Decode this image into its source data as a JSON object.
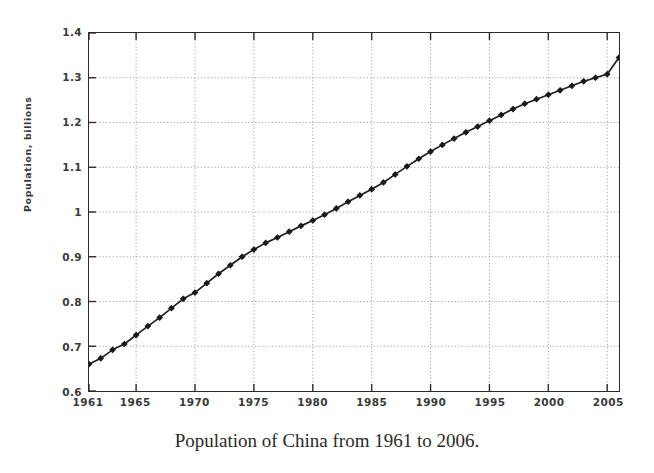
{
  "caption": "Population of China from 1961 to 2006.",
  "axes": {
    "y_title": "Population, billions",
    "y_tick_labels": [
      "1.4",
      "1.3",
      "1.2",
      "1.1",
      "1",
      "0.9",
      "0.8",
      "0.7",
      "0.6"
    ],
    "x_tick_labels": [
      "1961",
      "1965",
      "1970",
      "1975",
      "1980",
      "1985",
      "1990",
      "1995",
      "2000",
      "2005"
    ]
  },
  "colors": {
    "line": "#1f1f1f",
    "marker": "#1a1a1a",
    "grid": "#9a9a9a",
    "frame": "#2b2b2b",
    "text": "#3a3a3a",
    "background": "#ffffff"
  },
  "chart_data": {
    "type": "line",
    "title": "",
    "xlabel": "",
    "ylabel": "Population, billions",
    "xlim": [
      1961,
      2006
    ],
    "ylim": [
      0.6,
      1.4
    ],
    "grid": true,
    "legend": "none",
    "xticks": [
      1961,
      1965,
      1970,
      1975,
      1980,
      1985,
      1990,
      1995,
      2000,
      2005
    ],
    "yticks": [
      0.6,
      0.7,
      0.8,
      0.9,
      1.0,
      1.1,
      1.2,
      1.3,
      1.4
    ],
    "marker": "filled-diamond",
    "series": [
      {
        "name": "Population of China",
        "units": "billions",
        "x": [
          1961,
          1962,
          1963,
          1964,
          1965,
          1966,
          1967,
          1968,
          1969,
          1970,
          1971,
          1972,
          1973,
          1974,
          1975,
          1976,
          1977,
          1978,
          1979,
          1980,
          1981,
          1982,
          1983,
          1984,
          1985,
          1986,
          1987,
          1988,
          1989,
          1990,
          1991,
          1992,
          1993,
          1994,
          1995,
          1996,
          1997,
          1998,
          1999,
          2000,
          2001,
          2002,
          2003,
          2004,
          2005,
          2006
        ],
        "values": [
          0.66,
          0.673,
          0.692,
          0.705,
          0.725,
          0.745,
          0.764,
          0.785,
          0.806,
          0.82,
          0.841,
          0.862,
          0.881,
          0.9,
          0.916,
          0.931,
          0.943,
          0.956,
          0.969,
          0.981,
          0.994,
          1.008,
          1.023,
          1.037,
          1.051,
          1.066,
          1.084,
          1.102,
          1.119,
          1.135,
          1.15,
          1.164,
          1.178,
          1.191,
          1.204,
          1.217,
          1.23,
          1.242,
          1.252,
          1.262,
          1.272,
          1.282,
          1.292,
          1.3,
          1.308,
          1.345
        ]
      }
    ]
  }
}
